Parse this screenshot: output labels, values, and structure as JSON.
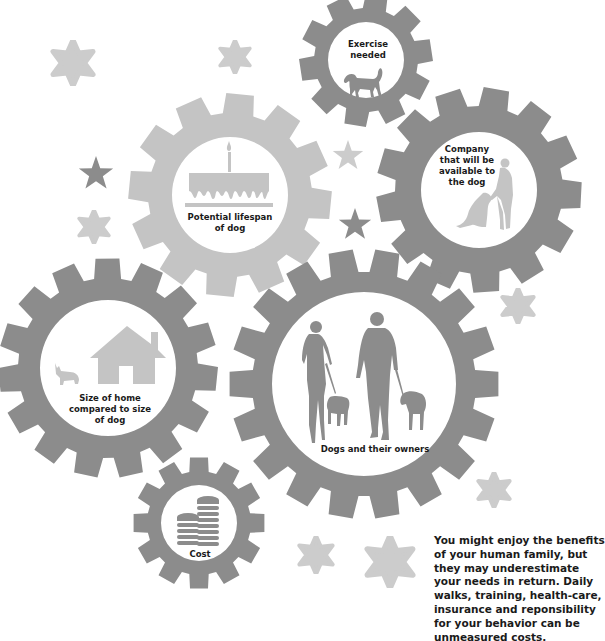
{
  "colors": {
    "gear_dark": "#8c8c8c",
    "gear_light": "#c4c4c4",
    "icon_dark": "#8c8c8c",
    "icon_light": "#c4c4c4",
    "star_dark": "#8c8c8c",
    "star_light": "#cccccc",
    "text": "#1a1a1a",
    "background": "#ffffff"
  },
  "gears": [
    {
      "id": "exercise",
      "label_lines": [
        "Exercise",
        "needed"
      ],
      "icon": "dog-icon",
      "shade": "dark"
    },
    {
      "id": "lifespan",
      "label_lines": [
        "Potential lifespan",
        "of dog"
      ],
      "icon": "birthday-cake-icon",
      "shade": "light"
    },
    {
      "id": "company",
      "label_lines": [
        "Company",
        "that will be",
        "available to",
        "the dog"
      ],
      "icon": "person-with-dog-icon",
      "shade": "dark"
    },
    {
      "id": "home-size",
      "label_lines": [
        "Size of home",
        "compared to size",
        "of dog"
      ],
      "icon": "house-and-corgi-icon",
      "shade": "dark"
    },
    {
      "id": "owners",
      "label_lines": [
        "Dogs and their owners"
      ],
      "icon": "people-walking-dogs-icon",
      "shade": "dark"
    },
    {
      "id": "cost",
      "label_lines": [
        "Cost"
      ],
      "icon": "coin-stacks-icon",
      "shade": "dark"
    }
  ],
  "body_text": {
    "lines": [
      "You might enjoy the benefits",
      "of your human family, but",
      "they may underestimate",
      "your needs in return. Daily",
      "walks, training, health-care,",
      "insurance and reponsibility",
      "for your behavior can be",
      "unmeasured costs."
    ]
  }
}
